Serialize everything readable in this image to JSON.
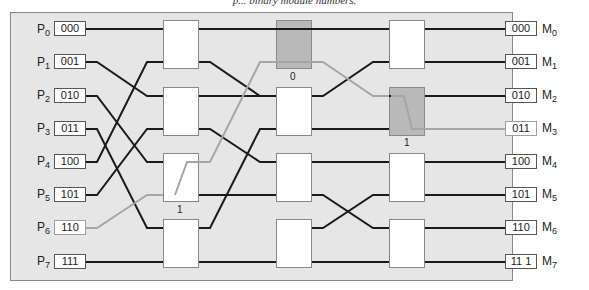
{
  "caption": "p... binary module numbers.",
  "colors": {
    "panel_bg": "#e6e6e6",
    "wire": "#1a1a1a",
    "route": "#a6a6a6",
    "active_switch": "#b9b9b9"
  },
  "inputs": [
    {
      "name": "P",
      "sub": "0",
      "addr": "000"
    },
    {
      "name": "P",
      "sub": "1",
      "addr": "001"
    },
    {
      "name": "P",
      "sub": "2",
      "addr": "010"
    },
    {
      "name": "P",
      "sub": "3",
      "addr": "011"
    },
    {
      "name": "P",
      "sub": "4",
      "addr": "100"
    },
    {
      "name": "P",
      "sub": "5",
      "addr": "101"
    },
    {
      "name": "P",
      "sub": "6",
      "addr": "110"
    },
    {
      "name": "P",
      "sub": "7",
      "addr": "111"
    }
  ],
  "outputs": [
    {
      "name": "M",
      "sub": "0",
      "addr": "000"
    },
    {
      "name": "M",
      "sub": "1",
      "addr": "001"
    },
    {
      "name": "M",
      "sub": "2",
      "addr": "010"
    },
    {
      "name": "M",
      "sub": "3",
      "addr": "011"
    },
    {
      "name": "M",
      "sub": "4",
      "addr": "100"
    },
    {
      "name": "M",
      "sub": "5",
      "addr": "101"
    },
    {
      "name": "M",
      "sub": "6",
      "addr": "110"
    },
    {
      "name": "M",
      "sub": "7",
      "addr": "11 1"
    }
  ],
  "switch_labels": {
    "stage1_sw2": "1",
    "stage2_sw0": "0",
    "stage3_sw1": "1"
  },
  "route": {
    "from": "P6 (110)",
    "to": "M3 (011)",
    "bits": [
      "1",
      "0",
      "1"
    ]
  }
}
